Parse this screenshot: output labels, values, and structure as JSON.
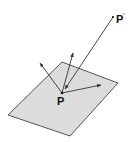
{
  "diagram": {
    "type": "geometric-illustration",
    "colors": {
      "plane_fill": "#dcdcdc",
      "plane_stroke": "#444444",
      "line": "#333333",
      "background": "#ffffff"
    },
    "plane": {
      "points": "8,115 62,62 118,83 70,136"
    },
    "point_p": {
      "x": 62,
      "y": 93
    },
    "point_p_prime": {
      "x": 113,
      "y": 17
    },
    "arrows": [
      {
        "name": "vector-upper-left",
        "x1": 62,
        "y1": 93,
        "x2": 40,
        "y2": 63
      },
      {
        "name": "vector-up",
        "x1": 62,
        "y1": 93,
        "x2": 73,
        "y2": 53
      },
      {
        "name": "vector-right",
        "x1": 62,
        "y1": 93,
        "x2": 101,
        "y2": 85
      },
      {
        "name": "ray-from-p-prime",
        "x1": 113,
        "y1": 17,
        "x2": 65,
        "y2": 89
      }
    ],
    "labels": {
      "p": "P",
      "p_prime": "P",
      "p_prime_mark": "′"
    }
  }
}
